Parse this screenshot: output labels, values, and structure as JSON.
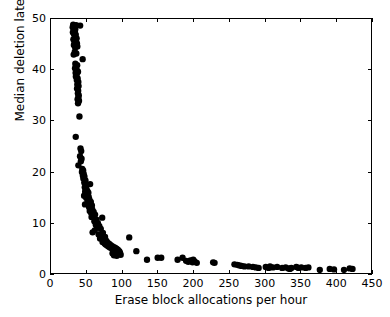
{
  "chart_data": {
    "type": "scatter",
    "title": "",
    "xlabel": "Erase block allocations per hour",
    "ylabel": "Median deletion latency (hours)",
    "xlim": [
      0,
      450
    ],
    "ylim": [
      0,
      50
    ],
    "xticks": [
      0,
      50,
      100,
      150,
      200,
      250,
      300,
      350,
      400,
      450
    ],
    "yticks": [
      0,
      10,
      20,
      30,
      40,
      50
    ],
    "grid": false,
    "legend": null,
    "marker": {
      "shape": "circle",
      "color": "#000000",
      "size_px": 3.2
    },
    "background_color": "#ffffff",
    "axes_color": "#000000",
    "ticks_on_all_sides": true,
    "n_points": 168,
    "points": [
      [
        30.5,
        48.4
      ],
      [
        31.2,
        48.9
      ],
      [
        32.0,
        48.2
      ],
      [
        33.0,
        48.6
      ],
      [
        34.1,
        48.0
      ],
      [
        35.3,
        48.8
      ],
      [
        41.0,
        48.7
      ],
      [
        30.8,
        47.4
      ],
      [
        32.4,
        47.0
      ],
      [
        33.6,
        47.6
      ],
      [
        34.8,
        46.9
      ],
      [
        36.0,
        46.2
      ],
      [
        31.5,
        46.0
      ],
      [
        33.0,
        45.5
      ],
      [
        35.0,
        45.8
      ],
      [
        36.5,
        45.2
      ],
      [
        32.2,
        44.9
      ],
      [
        34.0,
        44.4
      ],
      [
        37.0,
        44.6
      ],
      [
        33.4,
        43.5
      ],
      [
        31.9,
        43.0
      ],
      [
        35.6,
        43.2
      ],
      [
        44.5,
        42.1
      ],
      [
        34.2,
        41.2
      ],
      [
        36.8,
        40.9
      ],
      [
        33.8,
        40.3
      ],
      [
        35.4,
        40.0
      ],
      [
        37.2,
        39.8
      ],
      [
        34.6,
        39.4
      ],
      [
        36.1,
        39.1
      ],
      [
        38.0,
        39.6
      ],
      [
        35.0,
        38.7
      ],
      [
        37.5,
        38.3
      ],
      [
        36.3,
        38.0
      ],
      [
        38.4,
        37.6
      ],
      [
        37.0,
        37.1
      ],
      [
        38.8,
        36.8
      ],
      [
        36.6,
        36.3
      ],
      [
        38.2,
        35.9
      ],
      [
        37.8,
        35.4
      ],
      [
        39.0,
        35.0
      ],
      [
        38.5,
        34.6
      ],
      [
        37.4,
        34.2
      ],
      [
        39.4,
        33.9
      ],
      [
        38.0,
        33.4
      ],
      [
        40.0,
        30.8
      ],
      [
        34.8,
        26.8
      ],
      [
        41.5,
        24.5
      ],
      [
        42.5,
        24.0
      ],
      [
        40.8,
        23.0
      ],
      [
        43.0,
        22.5
      ],
      [
        42.0,
        22.0
      ],
      [
        38.5,
        21.2
      ],
      [
        44.0,
        20.5
      ],
      [
        45.2,
        20.2
      ],
      [
        43.5,
        19.9
      ],
      [
        46.0,
        19.5
      ],
      [
        44.8,
        19.2
      ],
      [
        47.0,
        19.0
      ],
      [
        45.5,
        18.6
      ],
      [
        48.5,
        18.2
      ],
      [
        46.8,
        17.8
      ],
      [
        55.0,
        17.5
      ],
      [
        50.0,
        17.2
      ],
      [
        47.5,
        16.9
      ],
      [
        49.0,
        16.5
      ],
      [
        51.0,
        16.2
      ],
      [
        48.0,
        16.0
      ],
      [
        52.5,
        15.8
      ],
      [
        50.5,
        15.5
      ],
      [
        46.5,
        15.2
      ],
      [
        53.0,
        15.0
      ],
      [
        49.5,
        14.8
      ],
      [
        54.0,
        14.5
      ],
      [
        51.5,
        14.2
      ],
      [
        56.0,
        14.0
      ],
      [
        52.0,
        13.8
      ],
      [
        47.8,
        13.5
      ],
      [
        57.5,
        13.3
      ],
      [
        53.5,
        13.0
      ],
      [
        55.5,
        12.8
      ],
      [
        58.0,
        12.5
      ],
      [
        54.5,
        12.2
      ],
      [
        60.0,
        12.0
      ],
      [
        56.5,
        11.8
      ],
      [
        62.0,
        11.5
      ],
      [
        59.0,
        11.2
      ],
      [
        57.0,
        11.0
      ],
      [
        72.0,
        10.9
      ],
      [
        64.0,
        10.5
      ],
      [
        61.0,
        10.2
      ],
      [
        66.0,
        9.8
      ],
      [
        63.0,
        9.5
      ],
      [
        68.0,
        9.2
      ],
      [
        65.0,
        9.0
      ],
      [
        70.0,
        8.7
      ],
      [
        61.5,
        8.4
      ],
      [
        58.5,
        8.0
      ],
      [
        73.0,
        7.9
      ],
      [
        67.0,
        7.6
      ],
      [
        71.0,
        7.3
      ],
      [
        76.0,
        7.1
      ],
      [
        110.0,
        7.0
      ],
      [
        69.0,
        6.8
      ],
      [
        74.0,
        6.5
      ],
      [
        78.0,
        6.3
      ],
      [
        72.5,
        6.1
      ],
      [
        80.0,
        5.9
      ],
      [
        75.5,
        5.8
      ],
      [
        82.0,
        5.7
      ],
      [
        77.0,
        5.6
      ],
      [
        84.0,
        5.5
      ],
      [
        79.0,
        5.4
      ],
      [
        86.0,
        5.3
      ],
      [
        81.0,
        5.2
      ],
      [
        88.0,
        5.1
      ],
      [
        83.0,
        5.0
      ],
      [
        90.0,
        5.0
      ],
      [
        85.0,
        4.9
      ],
      [
        92.0,
        4.8
      ],
      [
        87.0,
        4.7
      ],
      [
        94.0,
        4.6
      ],
      [
        89.0,
        4.5
      ],
      [
        91.0,
        4.4
      ],
      [
        96.0,
        4.3
      ],
      [
        93.0,
        4.2
      ],
      [
        120.0,
        4.3
      ],
      [
        95.0,
        4.1
      ],
      [
        97.0,
        4.0
      ],
      [
        86.5,
        3.9
      ],
      [
        90.5,
        3.8
      ],
      [
        94.5,
        3.7
      ],
      [
        98.0,
        3.6
      ],
      [
        88.5,
        3.5
      ],
      [
        92.5,
        3.4
      ],
      [
        135.0,
        2.6
      ],
      [
        150.0,
        3.0
      ],
      [
        155.0,
        3.0
      ],
      [
        178.0,
        2.6
      ],
      [
        185.0,
        3.0
      ],
      [
        190.0,
        2.4
      ],
      [
        193.0,
        2.2
      ],
      [
        196.0,
        2.5
      ],
      [
        199.0,
        2.1
      ],
      [
        202.0,
        2.3
      ],
      [
        205.0,
        2.0
      ],
      [
        200.0,
        2.6
      ],
      [
        228.0,
        2.1
      ],
      [
        262.0,
        1.6
      ],
      [
        265.0,
        1.5
      ],
      [
        268.0,
        1.4
      ],
      [
        278.0,
        1.3
      ],
      [
        284.0,
        1.2
      ],
      [
        292.0,
        1.0
      ],
      [
        302.0,
        1.2
      ],
      [
        308.0,
        1.3
      ],
      [
        312.0,
        1.1
      ],
      [
        318.0,
        1.2
      ],
      [
        325.0,
        1.0
      ],
      [
        330.0,
        1.1
      ],
      [
        334.0,
        0.9
      ],
      [
        338.0,
        1.0
      ],
      [
        345.0,
        1.2
      ],
      [
        352.0,
        1.1
      ],
      [
        358.0,
        1.0
      ],
      [
        362.0,
        1.1
      ],
      [
        378.0,
        0.6
      ],
      [
        392.0,
        0.8
      ],
      [
        398.0,
        0.7
      ],
      [
        412.0,
        0.6
      ],
      [
        420.0,
        0.9
      ],
      [
        424.0,
        0.8
      ],
      [
        230.0,
        2.0
      ],
      [
        258.0,
        1.7
      ],
      [
        288.0,
        1.1
      ],
      [
        348.0,
        1.0
      ],
      [
        336.0,
        0.8
      ],
      [
        306.0,
        1.0
      ],
      [
        272.0,
        1.3
      ]
    ]
  }
}
